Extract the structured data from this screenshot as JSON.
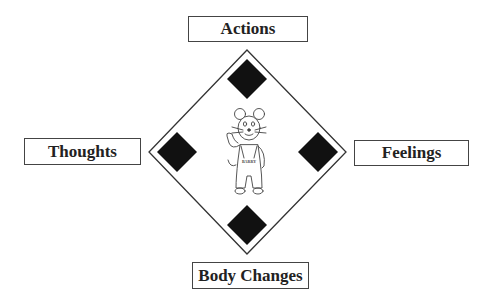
{
  "diagram": {
    "type": "cognitive-triangle-diamond",
    "labels": {
      "top": "Actions",
      "left": "Thoughts",
      "right": "Feelings",
      "bottom": "Body Changes"
    },
    "center_figure": {
      "description": "cartoon mouse in overalls waving",
      "overalls_text": "BARRY"
    },
    "colors": {
      "outline": "#333333",
      "marker": "#111111",
      "background": "#ffffff"
    }
  }
}
